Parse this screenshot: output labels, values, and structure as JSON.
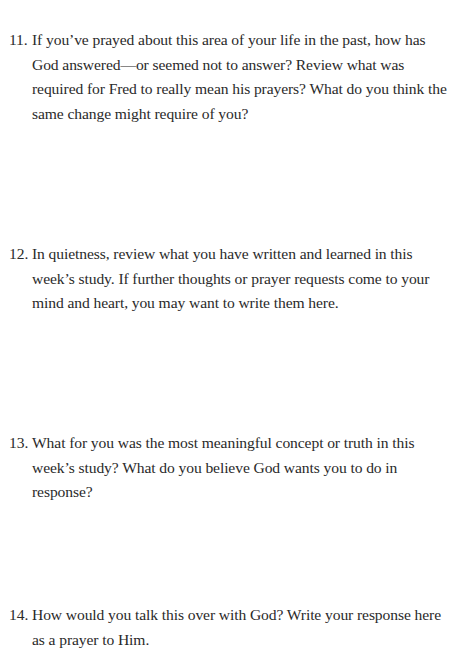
{
  "questions": [
    {
      "number": "11.",
      "text": "If you’ve prayed about this area of your life in the past, how has God answered—or seemed not to answer? Review what was required for Fred to really mean his prayers? What do you think the same change might require of you?"
    },
    {
      "number": "12.",
      "text": "In quietness, review what you have written and learned in this week’s study. If further thoughts or prayer requests come to your mind and heart, you may want to write them here."
    },
    {
      "number": "13.",
      "text": "What for you was the most meaningful concept or truth in this week’s study? What do you believe God wants you to do in response?"
    },
    {
      "number": "14.",
      "text": "How would you talk this over with God? Write your response here as a prayer to Him."
    }
  ]
}
